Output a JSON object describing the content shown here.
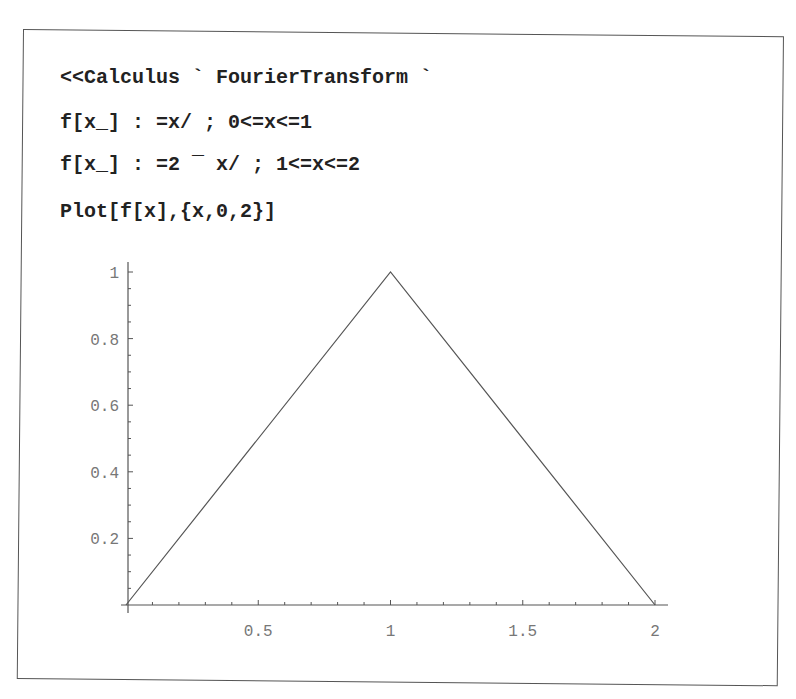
{
  "notebook": {
    "input_lines": [
      "<<Calculus`FourierTransform`",
      "f[x_] :=x/ ; 0<=x<=1",
      "f[x_] :=2 - x/ ; 1<=x<=2",
      "Plot[f[x],{x,0,2}]"
    ],
    "display_lines": [
      "<<Calculus ` FourierTransform `",
      "f[x_] : =x/ ; 0<=x<=1",
      "f[x_] : =2 ¯ x/ ; 1<=x<=2",
      "Plot[f[x],{x,0,2}]"
    ]
  },
  "chart_data": {
    "type": "line",
    "title": "",
    "xlabel": "",
    "ylabel": "",
    "xlim": [
      0,
      2
    ],
    "ylim": [
      0,
      1
    ],
    "grid": false,
    "legend": null,
    "x_ticks": [
      0.5,
      1,
      1.5,
      2
    ],
    "x_tick_labels": [
      "0.5",
      "1",
      "1.5",
      "2"
    ],
    "y_ticks": [
      0.2,
      0.4,
      0.6,
      0.8,
      1
    ],
    "y_tick_labels": [
      "0.2",
      "0.4",
      "0.6",
      "0.8",
      "1"
    ],
    "series": [
      {
        "name": "f[x]",
        "x": [
          0,
          1,
          2
        ],
        "y": [
          0,
          1,
          0
        ],
        "color": "#555555"
      }
    ]
  },
  "colors": {
    "frame": "#555555",
    "axis": "#555555",
    "curve": "#555555",
    "tick_label": "#777777",
    "code_text": "#222222"
  }
}
